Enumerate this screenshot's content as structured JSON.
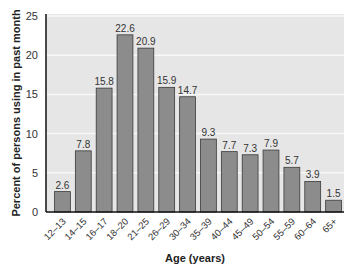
{
  "chart_data": {
    "type": "bar",
    "title": "",
    "xlabel": "Age (years)",
    "ylabel": "Percent of persons using in past month",
    "ylim": [
      0,
      25
    ],
    "yticks": [
      0,
      5,
      10,
      15,
      20,
      25
    ],
    "grid": true,
    "legend": null,
    "categories": [
      "12–13",
      "14–15",
      "16–17",
      "18–20",
      "21–25",
      "26–29",
      "30–34",
      "35–39",
      "40–44",
      "45–49",
      "50–54",
      "55–59",
      "60–64",
      "65+"
    ],
    "values": [
      2.6,
      7.8,
      15.8,
      22.6,
      20.9,
      15.9,
      14.7,
      9.3,
      7.7,
      7.3,
      7.9,
      5.7,
      3.9,
      1.5
    ],
    "data_labels": [
      "2.6",
      "7.8",
      "15.8",
      "22.6",
      "20.9",
      "15.9",
      "14.7",
      "9.3",
      "7.7",
      "7.3",
      "7.9",
      "5.7",
      "3.9",
      "1.5"
    ]
  },
  "colors": {
    "bar_fill": "#8c8c8c",
    "bar_stroke": "#3a3a3a",
    "plot_bg": "#e6e6e6",
    "grid": "#f8f8f8",
    "axis": "#111111"
  }
}
